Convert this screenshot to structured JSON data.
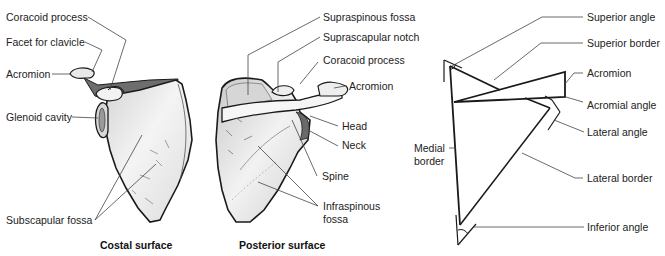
{
  "figures": {
    "costal": {
      "caption": "Costal surface",
      "labels": {
        "coracoid_process": "Coracoid process",
        "facet_for_clavicle": "Facet for clavicle",
        "acromion": "Acromion",
        "glenoid_cavity": "Glenoid cavity",
        "subscapular_fossa": "Subscapular fossa"
      }
    },
    "posterior": {
      "caption": "Posterior surface",
      "labels": {
        "supraspinous_fossa": "Supraspinous fossa",
        "suprascapular_notch": "Suprascapular notch",
        "coracoid_process": "Coracoid process",
        "acromion": "Acromion",
        "head": "Head",
        "neck": "Neck",
        "spine": "Spine",
        "infraspinous_fossa_line1": "Infraspinous",
        "infraspinous_fossa_line2": "fossa"
      }
    },
    "schematic": {
      "labels": {
        "superior_angle": "Superior angle",
        "superior_border": "Superior border",
        "acromion": "Acromion",
        "acromial_angle": "Acromial angle",
        "lateral_angle": "Lateral angle",
        "medial_border_line1": "Medial",
        "medial_border_line2": "border",
        "lateral_border": "Lateral border",
        "inferior_angle": "Inferior angle"
      }
    }
  },
  "colors": {
    "bone_fill": "#ececec",
    "bone_shade": "#bdbdbd",
    "outline": "#1a1a1a",
    "leader": "#444444"
  }
}
